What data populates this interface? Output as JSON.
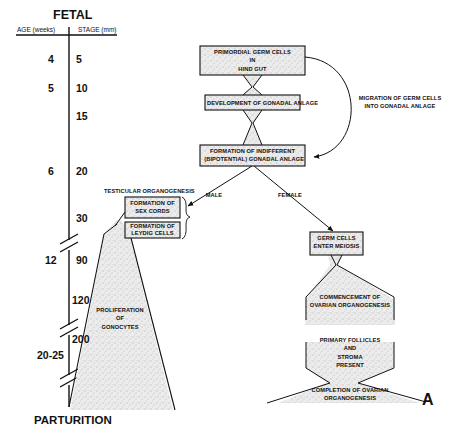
{
  "header": {
    "title": "FETAL",
    "age_column": "AGE (weeks)",
    "stage_column": "STAGE (mm)"
  },
  "footer": {
    "label": "PARTURITION",
    "panel_letter": "A"
  },
  "timeline": {
    "ages": [
      "4",
      "5",
      "6",
      "12",
      "20-25"
    ],
    "stages": [
      "5",
      "10",
      "15",
      "20",
      "30",
      "90",
      "120",
      "200"
    ]
  },
  "nodes": {
    "pgc": "PRIMORDIAL GERM CELLS\nIN\nHIND GUT",
    "pgc_l1": "PRIMORDIAL GERM CELLS",
    "pgc_l2": "IN",
    "pgc_l3": "HIND GUT",
    "gonadal_anlage": "DEVELOPMENT OF GONADAL ANLAGE",
    "indiff_l1": "FORMATION OF INDIFFERENT",
    "indiff_l2": "(BIPOTENTIAL) GONADAL ANLAGE",
    "migration_l1": "MIGRATION OF GERM CELLS",
    "migration_l2": "INTO GONADAL ANLAGE",
    "male": "MALE",
    "female": "FEMALE",
    "testicular": "TESTICULAR ORGANOGENESIS",
    "sex_cords_l1": "FORMATION OF",
    "sex_cords_l2": "SEX CORDS",
    "leydig_l1": "FORMATION OF",
    "leydig_l2": "LEYDIG CELLS",
    "gonocytes_l1": "PROLIFERATION",
    "gonocytes_l2": "OF",
    "gonocytes_l3": "GONOCYTES",
    "meiosis_l1": "GERM CELLS",
    "meiosis_l2": "ENTER MEIOSIS",
    "ovarian_start_l1": "COMMENCEMENT OF",
    "ovarian_start_l2": "OVARIAN ORGANOGENESIS",
    "follicles_l1": "PRIMARY FOLLICLES",
    "follicles_l2": "AND",
    "follicles_l3": "STROMA",
    "follicles_l4": "PRESENT",
    "ovarian_end_l1": "COMPLETION OF OVARIAN",
    "ovarian_end_l2": "ORGANOGENESIS"
  },
  "colors": {
    "ink": "#111111",
    "stipple_fill": "#e4e4e4",
    "background": "#ffffff"
  }
}
